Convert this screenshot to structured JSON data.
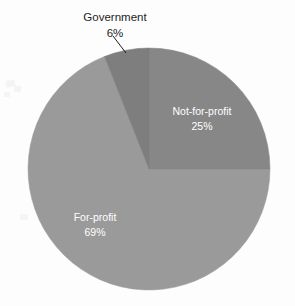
{
  "background_color": "#fdfdfd",
  "chart_data": {
    "type": "pie",
    "title": "",
    "categories": [
      "Not-for-profit",
      "For-profit",
      "Government"
    ],
    "values": [
      25,
      69,
      6
    ],
    "value_labels": [
      "25%",
      "69%",
      "6%"
    ],
    "unit": "%",
    "start_angle_deg": 0,
    "direction": "clockwise",
    "legend": "none",
    "grid": false,
    "slices": [
      {
        "name": "Not-for-profit",
        "value": 25,
        "value_label": "25%",
        "color": "#878787",
        "label_color": "#ffffff",
        "label_placement": "inside",
        "start_angle_deg": 0,
        "end_angle_deg": 90
      },
      {
        "name": "For-profit",
        "value": 69,
        "value_label": "69%",
        "color": "#9a9a9a",
        "label_color": "#ffffff",
        "label_placement": "inside",
        "start_angle_deg": 90,
        "end_angle_deg": 338.4
      },
      {
        "name": "Government",
        "value": 6,
        "value_label": "6%",
        "color": "#7e7e7e",
        "label_color": "#1d1d1d",
        "label_placement": "outside",
        "start_angle_deg": 338.4,
        "end_angle_deg": 360
      }
    ],
    "geometry": {
      "center_x": 149,
      "center_y": 169,
      "radius": 121
    }
  }
}
